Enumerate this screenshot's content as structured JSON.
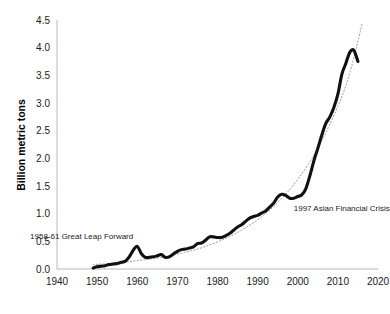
{
  "chart_data": {
    "type": "line",
    "title": "",
    "subtitle": "",
    "xlabel": "",
    "ylabel": "Billion metric tons",
    "xlim": [
      1940,
      2020
    ],
    "ylim": [
      0.0,
      4.5
    ],
    "grid": false,
    "legend": "none",
    "x_ticks": [
      "1940",
      "1950",
      "1960",
      "1970",
      "1980",
      "1990",
      "2000",
      "2010",
      "2020"
    ],
    "y_ticks": [
      "0.0",
      "0.5",
      "1.0",
      "1.5",
      "2.0",
      "2.5",
      "3.0",
      "3.5",
      "4.0",
      "4.5"
    ],
    "series": [
      {
        "name": "Emissions",
        "style": "solid-thick",
        "color": "#111111",
        "x": [
          1949,
          1950,
          1951,
          1952,
          1953,
          1954,
          1955,
          1956,
          1957,
          1958,
          1959,
          1960,
          1961,
          1962,
          1963,
          1964,
          1965,
          1966,
          1967,
          1968,
          1969,
          1970,
          1971,
          1972,
          1973,
          1974,
          1975,
          1976,
          1977,
          1978,
          1979,
          1980,
          1981,
          1982,
          1983,
          1984,
          1985,
          1986,
          1987,
          1988,
          1989,
          1990,
          1991,
          1992,
          1993,
          1994,
          1995,
          1996,
          1997,
          1998,
          1999,
          2000,
          2001,
          2002,
          2003,
          2004,
          2005,
          2006,
          2007,
          2008,
          2009,
          2010,
          2011,
          2012,
          2013,
          2014,
          2015
        ],
        "values": [
          0.02,
          0.04,
          0.05,
          0.06,
          0.08,
          0.09,
          0.1,
          0.12,
          0.14,
          0.22,
          0.34,
          0.41,
          0.28,
          0.21,
          0.21,
          0.22,
          0.24,
          0.26,
          0.21,
          0.22,
          0.27,
          0.32,
          0.35,
          0.36,
          0.38,
          0.4,
          0.46,
          0.47,
          0.52,
          0.58,
          0.58,
          0.57,
          0.57,
          0.6,
          0.64,
          0.7,
          0.76,
          0.8,
          0.86,
          0.92,
          0.95,
          0.97,
          1.01,
          1.05,
          1.12,
          1.19,
          1.3,
          1.35,
          1.33,
          1.28,
          1.28,
          1.31,
          1.34,
          1.45,
          1.68,
          1.95,
          2.18,
          2.42,
          2.63,
          2.75,
          2.92,
          3.16,
          3.52,
          3.72,
          3.92,
          3.95,
          3.75
        ]
      },
      {
        "name": "Exponential trend",
        "style": "dotted",
        "color": "#9a9a9a",
        "x": [
          1949,
          1955,
          1960,
          1965,
          1970,
          1975,
          1980,
          1985,
          1990,
          1995,
          2000,
          2005,
          2010,
          2013,
          2016
        ],
        "values": [
          0.08,
          0.11,
          0.15,
          0.2,
          0.27,
          0.36,
          0.49,
          0.66,
          0.89,
          1.2,
          1.62,
          2.18,
          2.94,
          3.55,
          4.42
        ]
      }
    ],
    "annotations": [
      {
        "text": "1958-61 Great Leap Forward",
        "x": 1959,
        "y": 0.55,
        "anchor": "end"
      },
      {
        "text": "1997 Asian Financial Crisis",
        "x": 1999,
        "y": 1.05,
        "anchor": "start"
      }
    ]
  }
}
